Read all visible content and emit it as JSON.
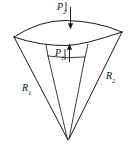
{
  "figure": {
    "background_color": "#ffffff",
    "line_color": "#1a1a1a",
    "width": 134,
    "height": 152,
    "labels": {
      "p2": {
        "symbol": "P",
        "subscript": "2",
        "full": "P2",
        "role": "pressure-on-outer-top-surface"
      },
      "p1": {
        "symbol": "P",
        "subscript": "1",
        "full": "P1",
        "role": "pressure-on-inner-surface"
      },
      "r1": {
        "symbol": "R",
        "subscript": "1",
        "full": "R1",
        "role": "left-radial-edge"
      },
      "r2": {
        "symbol": "R",
        "subscript": "2",
        "full": "R2",
        "role": "right-radial-edge"
      }
    },
    "arrows": [
      {
        "name": "p2-arrow",
        "direction": "down",
        "points_to": "top-back-curved-surface"
      },
      {
        "name": "p1-arrow",
        "direction": "up",
        "points_to": "front-curved-edge"
      }
    ],
    "geometry": {
      "apex": [
        68,
        140
      ],
      "top_left_corner": [
        14,
        37
      ],
      "top_right_corner": [
        122,
        32
      ],
      "front_left_vertex": [
        46,
        44
      ],
      "front_right_vertex": [
        88,
        43
      ],
      "back_curve_peak": [
        66,
        21
      ],
      "front_curve_peak": [
        67,
        45
      ]
    }
  }
}
